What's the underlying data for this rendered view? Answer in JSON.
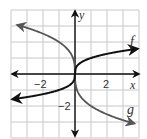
{
  "chart_data": {
    "type": "line",
    "title": "",
    "xlabel": "x",
    "ylabel": "y",
    "xlim": [
      -4,
      4
    ],
    "ylim": [
      -4,
      4
    ],
    "grid": true,
    "x_tick_labels": [
      "-2",
      "2"
    ],
    "y_tick_labels": [
      "-2"
    ],
    "series": [
      {
        "name": "f",
        "label": "f",
        "color": "#111111",
        "equation": "y = cbrt(x)",
        "x": [
          -4,
          -2,
          -1,
          0,
          1,
          2,
          4
        ],
        "values": [
          -1.59,
          -1.26,
          -1,
          0,
          1,
          1.26,
          1.59
        ]
      },
      {
        "name": "g",
        "label": "g",
        "color": "#555555",
        "equation": "y = -2*cbrt(x)",
        "x": [
          -4,
          -2,
          -1,
          0,
          1,
          2,
          4
        ],
        "values": [
          3.17,
          2.52,
          2,
          0,
          -2,
          -2.52,
          -3.17
        ]
      }
    ]
  },
  "labels": {
    "x_axis": "x",
    "y_axis": "y",
    "x_neg2": "−2",
    "x_pos2": "2",
    "y_neg2": "−2",
    "f": "f",
    "g": "g"
  }
}
